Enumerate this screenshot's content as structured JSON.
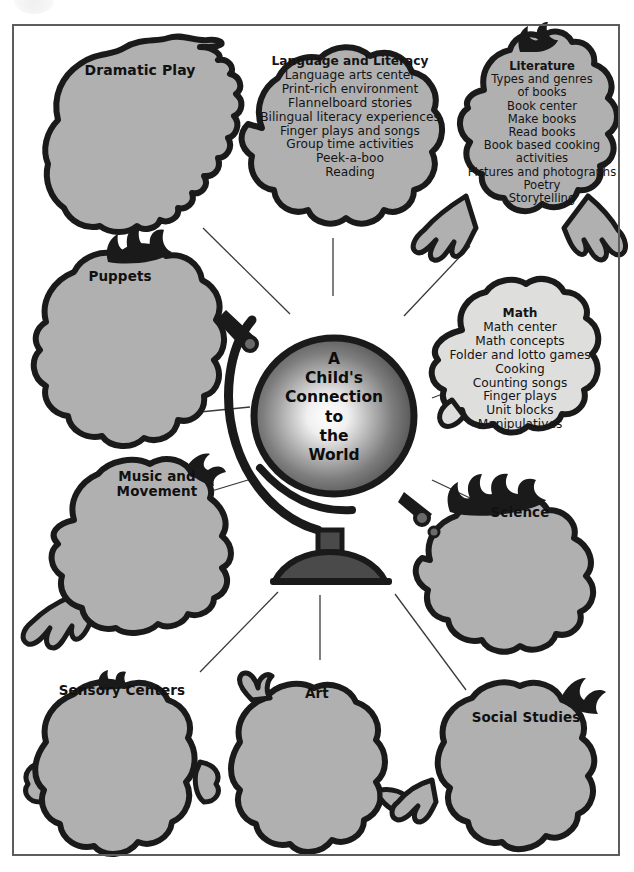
{
  "poster": {
    "center_title_lines": [
      "A",
      "Child's",
      "Connection",
      "to",
      "the",
      "World"
    ],
    "center_title": "A Child's Connection to the World",
    "center_icon": "globe-icon",
    "watermark_icon": "partial-seal-watermark-icon",
    "fill_gray": "#b0b0b0",
    "outline_black": "#1a1a1a",
    "frame_gray": "#5d5d5d",
    "line_gray": "#3a3a3a",
    "background": "#ffffff"
  },
  "nodes": [
    {
      "id": "dramatic-play",
      "label": "Dramatic Play",
      "icon": "head-silhouette-icon",
      "items": []
    },
    {
      "id": "language-and-literacy",
      "label": "Language\nand Literacy",
      "icon": "head-silhouette-icon",
      "items": [
        "Language arts center",
        "Print-rich environment",
        "Flannelboard stories",
        "Bilingual literacy experiences",
        "Finger plays and songs",
        "Group time activities",
        "Peek-a-boo",
        "Reading"
      ]
    },
    {
      "id": "literature",
      "label": "Literature",
      "icon": "head-silhouette-icon",
      "items": [
        "Types and genres",
        "of books",
        "Book center",
        "Make books",
        "Read books",
        "Book based cooking activities",
        "Pictures and photographs",
        "Poetry",
        "Storytelling"
      ]
    },
    {
      "id": "math",
      "label": "Math",
      "icon": "head-silhouette-icon",
      "items": [
        "Math center",
        "Math concepts",
        "Folder and lotto games",
        "Cooking",
        "Counting songs",
        "Finger plays",
        "Unit blocks",
        "Manipulatives"
      ]
    },
    {
      "id": "puppets",
      "label": "Puppets",
      "icon": "head-silhouette-icon",
      "items": []
    },
    {
      "id": "music-and-movement",
      "label": "Music and\nMovement",
      "icon": "head-silhouette-icon",
      "items": []
    },
    {
      "id": "science",
      "label": "Science",
      "icon": "head-silhouette-icon",
      "items": []
    },
    {
      "id": "sensory-centers",
      "label": "Sensory Centers",
      "icon": "head-silhouette-icon",
      "items": []
    },
    {
      "id": "art",
      "label": "Art",
      "icon": "head-silhouette-icon",
      "items": []
    },
    {
      "id": "social-studies",
      "label": "Social Studies",
      "icon": "head-silhouette-icon",
      "items": []
    }
  ]
}
